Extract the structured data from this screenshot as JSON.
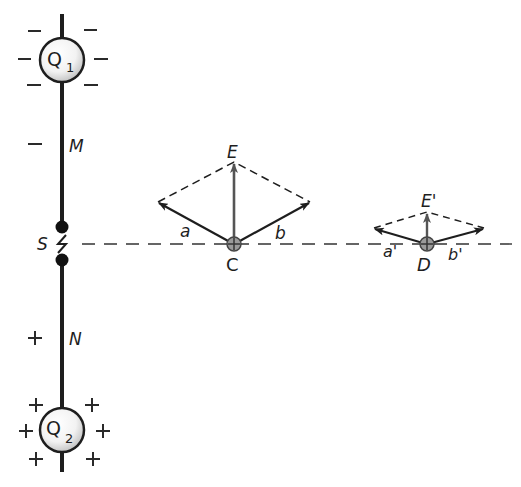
{
  "diagram": {
    "type": "electric field vector diagram",
    "charges": {
      "top": {
        "label_main": "Q",
        "label_sub": "1",
        "sign": "−"
      },
      "bottom": {
        "label_main": "Q",
        "label_sub": "2",
        "sign": "+"
      }
    },
    "rod_labels": {
      "upper": "M",
      "lower": "N",
      "gap": "S"
    },
    "side_signs": {
      "upper": "−",
      "lower": "+"
    },
    "point_C": {
      "label": "C",
      "resultant_label": "E",
      "component_a_label": "a",
      "component_b_label": "b"
    },
    "point_D": {
      "label": "D",
      "resultant_label": "E'",
      "component_a_label": "a'",
      "component_b_label": "b'"
    },
    "colors": {
      "ink": "#1e1e1e",
      "resultant": "#555555",
      "dashed": "#333333",
      "background": "#ffffff"
    }
  }
}
